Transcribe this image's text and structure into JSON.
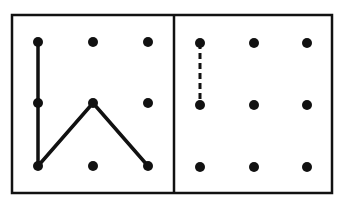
{
  "figure": {
    "width": 348,
    "height": 214,
    "stroke_color": "#111111",
    "background": "#ffffff",
    "outer_frame": {
      "x": 12,
      "y": 15,
      "width": 320,
      "height": 178,
      "stroke_width": 2.5
    },
    "divider_x": 174,
    "panels": [
      {
        "id": "left",
        "dot_radius": 5,
        "dots_x": [
          38,
          93,
          148
        ],
        "dots_y": [
          42,
          103,
          166
        ],
        "solid_path": [
          [
            38,
            42
          ],
          [
            38,
            103
          ],
          [
            38,
            166
          ],
          [
            93,
            103
          ],
          [
            148,
            166
          ]
        ],
        "dashed_path": []
      },
      {
        "id": "right",
        "dot_radius": 5,
        "dots_x": [
          200,
          254,
          307
        ],
        "dots_y": [
          43,
          105,
          167
        ],
        "solid_path": [],
        "dashed_path": [
          [
            200,
            43
          ],
          [
            200,
            105
          ]
        ]
      }
    ]
  }
}
